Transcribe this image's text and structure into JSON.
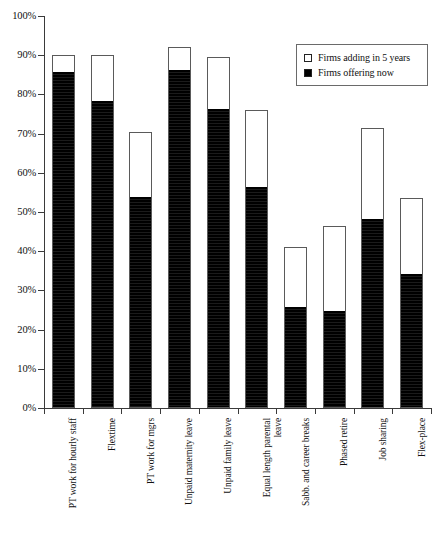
{
  "chart_data": {
    "type": "bar",
    "subtype": "stacked-vertical",
    "title": "",
    "xlabel": "",
    "ylabel": "",
    "ylim": [
      0,
      100
    ],
    "grid": false,
    "legend_position": "top-right",
    "y_ticks": [
      "0%",
      "10%",
      "20%",
      "30%",
      "40%",
      "50%",
      "60%",
      "70%",
      "80%",
      "90%",
      "100%"
    ],
    "y_tick_values": [
      0,
      10,
      20,
      30,
      40,
      50,
      60,
      70,
      80,
      90,
      100
    ],
    "categories": [
      "PT work for hourly staff",
      "Flextime",
      "PT work for mgrs",
      "Unpaid maternity leave",
      "Unpaid family leave",
      "Equal length parental\nleave",
      "Sabb. and career breaks",
      "Phased retire",
      "Job sharing",
      "Flex-place"
    ],
    "series": [
      {
        "name": "Firms offering now",
        "swatch": "filled",
        "color": "#000000",
        "values": [
          85.5,
          78.0,
          53.5,
          86.0,
          76.0,
          56.0,
          25.5,
          24.5,
          48.0,
          34.0
        ]
      },
      {
        "name": "Firms adding in 5 years",
        "swatch": "hollow",
        "color": "#ffffff",
        "values": [
          4.5,
          12.0,
          17.0,
          6.0,
          13.5,
          20.0,
          15.5,
          22.0,
          23.5,
          19.5
        ]
      }
    ],
    "totals": [
      90.0,
      90.0,
      70.5,
      92.0,
      89.5,
      76.0,
      41.0,
      46.5,
      71.5,
      53.5
    ]
  },
  "legend": {
    "items": [
      {
        "label": "Firms adding in 5 years",
        "swatch": "hollow"
      },
      {
        "label": "Firms offering now",
        "swatch": "filled"
      }
    ]
  }
}
